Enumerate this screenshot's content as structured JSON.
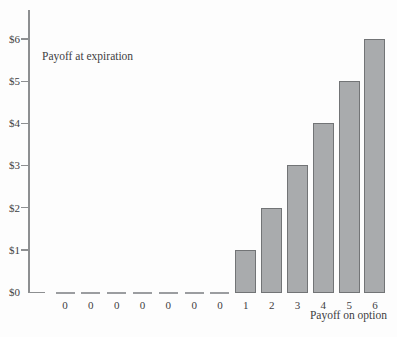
{
  "chart": {
    "inner_label": "Payoff at expiration",
    "xlabel": "Payoff on option"
  },
  "chart_data": {
    "type": "bar",
    "title": "Payoff at expiration",
    "xlabel": "Payoff on option",
    "ylabel": "",
    "categories": [
      "0",
      "0",
      "0",
      "0",
      "0",
      "0",
      "0",
      "1",
      "2",
      "3",
      "4",
      "5",
      "6"
    ],
    "values": [
      0,
      0,
      0,
      0,
      0,
      0,
      0,
      1,
      2,
      3,
      4,
      5,
      6
    ],
    "y_tick_labels": [
      "$0",
      "$1",
      "$2",
      "$3",
      "$4",
      "$5",
      "$6"
    ],
    "y_tick_values": [
      0,
      1,
      2,
      3,
      4,
      5,
      6
    ],
    "ylim": [
      0,
      6
    ],
    "grid": false,
    "legend_position": "none",
    "zero_marker_style": "flat-dash",
    "bar_color": "#a9abad",
    "bar_border_color": "#727476",
    "axis_color": "#8d8f91",
    "text_color": "#3e4042"
  }
}
